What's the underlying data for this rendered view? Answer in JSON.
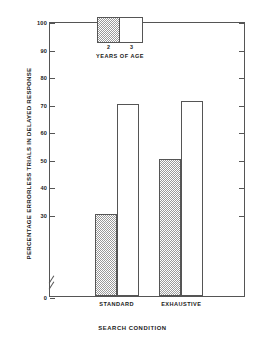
{
  "chart_data": {
    "type": "bar",
    "title": "",
    "categories": [
      "STANDARD",
      "EXHAUSTIVE"
    ],
    "series": [
      {
        "name": "2",
        "values": [
          30,
          70
        ]
      },
      {
        "name": "3",
        "values": [
          50,
          71
        ]
      }
    ],
    "series_order_note": "",
    "xlabel": "SEARCH CONDITION",
    "ylabel": "PERCENTAGE ERRORLESS TRIALS IN DELAYED RESPONSE",
    "ylim": [
      0,
      100
    ],
    "yticks": [
      0,
      30,
      40,
      50,
      60,
      70,
      80,
      90,
      100
    ],
    "ytick_labels": [
      "0",
      "30",
      "40",
      "50",
      "60",
      "70",
      "80",
      "90",
      "100"
    ],
    "axis_break": true,
    "grid": false,
    "legend_position": "top-center",
    "legend_title": "YEARS OF AGE",
    "legend_entries": [
      {
        "label": "2",
        "fill": "hatched"
      },
      {
        "label": "3",
        "fill": "open"
      }
    ],
    "bars": [
      {
        "category": "STANDARD",
        "series": "2",
        "value": 30,
        "fill": "hatched"
      },
      {
        "category": "STANDARD",
        "series": "3",
        "value": 70,
        "fill": "open"
      },
      {
        "category": "EXHAUSTIVE",
        "series": "2",
        "value": 50,
        "fill": "hatched"
      },
      {
        "category": "EXHAUSTIVE",
        "series": "3",
        "value": 71,
        "fill": "open"
      }
    ],
    "colors": {
      "axis": "#555555",
      "hatch": "#9a9a9a",
      "background": "#ffffff",
      "text": "#1a1a1a"
    }
  }
}
